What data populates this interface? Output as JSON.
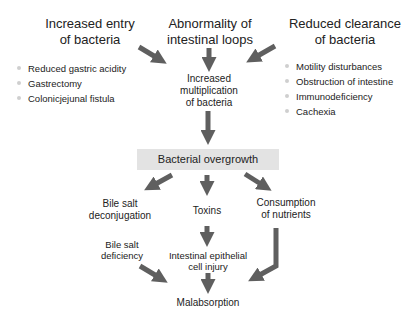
{
  "diagram": {
    "title_nodes": {
      "left": [
        "Increased entry",
        "of bacteria"
      ],
      "center": [
        "Abnormality of",
        "intestinal loops"
      ],
      "right": [
        "Reduced clearance",
        "of bacteria"
      ]
    },
    "left_causes": [
      "Reduced gastric acidity",
      "Gastrectomy",
      "Colonicjejunal fistula"
    ],
    "right_causes": [
      "Motility disturbances",
      "Obstruction of intestine",
      "Immunodeficiency",
      "Cachexia"
    ],
    "increased_multiplication": [
      "Increased",
      "multiplication",
      "of bacteria"
    ],
    "central_box": "Bacterial overgrowth",
    "effects": {
      "bile_salt_deconjugation": [
        "Bile salt",
        "deconjugation"
      ],
      "toxins": "Toxins",
      "consumption_of_nutrients": [
        "Consumption",
        "of nutrients"
      ]
    },
    "bile_salt_deficiency": [
      "Bile salt",
      "deficiency"
    ],
    "epithelial_injury": [
      "Intestinal epithelial",
      "cell injury"
    ],
    "outcome": "Malabsorption",
    "colors": {
      "arrow": "#5f5f5f",
      "box": "#e3e3e3",
      "bullet": "#cfcfcf",
      "text": "#222222"
    }
  }
}
